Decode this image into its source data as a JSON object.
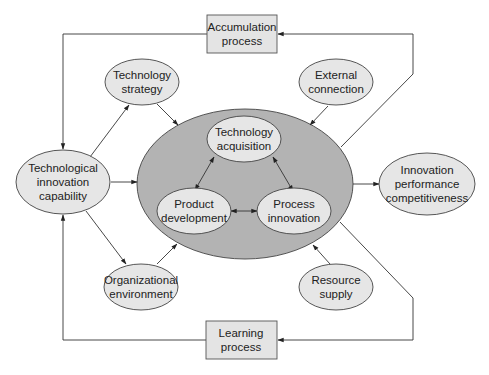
{
  "diagram": {
    "colors": {
      "background": "#ffffff",
      "node_fill": "#e6e6e6",
      "box_fill": "#e4e4e4",
      "core_fill": "#b3b3b3",
      "stroke": "#333333",
      "text": "#222222"
    },
    "nodes": {
      "accumulation": {
        "line1": "Accumulation",
        "line2": "process"
      },
      "learning": {
        "line1": "Learning",
        "line2": "process"
      },
      "tech_strategy": {
        "line1": "Technology",
        "line2": "strategy"
      },
      "external_connection": {
        "line1": "External",
        "line2": "connection"
      },
      "tech_innovation_capability": {
        "line1": "Technological",
        "line2": "innovation",
        "line3": "capability"
      },
      "innovation_performance": {
        "line1": "Innovation",
        "line2": "performance",
        "line3": "competitiveness"
      },
      "org_environment": {
        "line1": "Organizational",
        "line2": "environment"
      },
      "resource_supply": {
        "line1": "Resource",
        "line2": "supply"
      },
      "tech_acquisition": {
        "line1": "Technology",
        "line2": "acquisition"
      },
      "product_development": {
        "line1": "Product",
        "line2": "development"
      },
      "process_innovation": {
        "line1": "Process",
        "line2": "innovation"
      }
    },
    "edges": [
      {
        "from": "core",
        "to": "accumulation",
        "type": "arrow"
      },
      {
        "from": "accumulation",
        "to": "tech_innovation_capability",
        "type": "arrow"
      },
      {
        "from": "core",
        "to": "learning",
        "type": "arrow"
      },
      {
        "from": "learning",
        "to": "tech_innovation_capability",
        "type": "arrow"
      },
      {
        "from": "tech_innovation_capability",
        "to": "core",
        "type": "arrow"
      },
      {
        "from": "core",
        "to": "innovation_performance",
        "type": "arrow"
      },
      {
        "from": "tech_innovation_capability",
        "to": "tech_strategy",
        "type": "arrow"
      },
      {
        "from": "tech_strategy",
        "to": "core",
        "type": "arrow"
      },
      {
        "from": "external_connection",
        "to": "core",
        "type": "arrow"
      },
      {
        "from": "tech_innovation_capability",
        "to": "org_environment",
        "type": "arrow"
      },
      {
        "from": "org_environment",
        "to": "core",
        "type": "arrow"
      },
      {
        "from": "resource_supply",
        "to": "core",
        "type": "arrow"
      },
      {
        "from": "tech_acquisition",
        "to": "product_development",
        "type": "bidirectional"
      },
      {
        "from": "tech_acquisition",
        "to": "process_innovation",
        "type": "bidirectional"
      },
      {
        "from": "product_development",
        "to": "process_innovation",
        "type": "bidirectional"
      }
    ]
  }
}
